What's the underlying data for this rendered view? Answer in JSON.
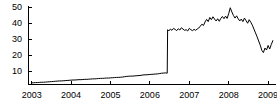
{
  "chart_data": {
    "type": "line",
    "title": "",
    "xlabel": "",
    "ylabel": "",
    "xlim": [
      2002.92,
      2009.2
    ],
    "ylim": [
      2.0,
      51.0
    ],
    "grid": false,
    "legend": null,
    "yticks": [
      10,
      20,
      30,
      40,
      50
    ],
    "ytick_labels": [
      "10",
      "20",
      "30",
      "40",
      "50"
    ],
    "xticks": [
      2003,
      2004,
      2005,
      2006,
      2007,
      2008,
      2009
    ],
    "xtick_labels": [
      "2003",
      "2004",
      "2005",
      "2006",
      "2007",
      "2008",
      "2009"
    ],
    "line_color": "#000000",
    "line_width": 1.0,
    "axis_color": "#000000",
    "background": "#ffffff",
    "annotations": [
      {
        "text": "level jump at mid-2006 from about 9 to about 36",
        "x": 2006.45,
        "y": 36
      }
    ],
    "series": [
      {
        "name": "series-1",
        "x": [
          2003.0,
          2003.05,
          2003.1,
          2003.15,
          2003.2,
          2003.25,
          2003.3,
          2003.35,
          2003.4,
          2003.45,
          2003.5,
          2003.55,
          2003.6,
          2003.65,
          2003.7,
          2003.75,
          2003.8,
          2003.85,
          2003.9,
          2003.95,
          2004.0,
          2004.05,
          2004.1,
          2004.15,
          2004.2,
          2004.25,
          2004.3,
          2004.35,
          2004.4,
          2004.45,
          2004.5,
          2004.55,
          2004.6,
          2004.65,
          2004.7,
          2004.75,
          2004.8,
          2004.85,
          2004.9,
          2004.95,
          2005.0,
          2005.05,
          2005.1,
          2005.15,
          2005.2,
          2005.25,
          2005.3,
          2005.35,
          2005.4,
          2005.45,
          2005.5,
          2005.55,
          2005.6,
          2005.65,
          2005.7,
          2005.75,
          2005.8,
          2005.85,
          2005.9,
          2005.95,
          2006.0,
          2006.05,
          2006.1,
          2006.15,
          2006.2,
          2006.25,
          2006.3,
          2006.35,
          2006.4,
          2006.44,
          2006.45,
          2006.48,
          2006.52,
          2006.56,
          2006.6,
          2006.64,
          2006.68,
          2006.72,
          2006.76,
          2006.8,
          2006.84,
          2006.88,
          2006.92,
          2006.96,
          2007.0,
          2007.04,
          2007.08,
          2007.12,
          2007.16,
          2007.2,
          2007.24,
          2007.28,
          2007.32,
          2007.36,
          2007.4,
          2007.44,
          2007.48,
          2007.52,
          2007.56,
          2007.6,
          2007.64,
          2007.68,
          2007.72,
          2007.76,
          2007.8,
          2007.84,
          2007.88,
          2007.92,
          2007.96,
          2008.0,
          2008.04,
          2008.08,
          2008.12,
          2008.16,
          2008.2,
          2008.24,
          2008.28,
          2008.32,
          2008.36,
          2008.4,
          2008.44,
          2008.48,
          2008.52,
          2008.56,
          2008.6,
          2008.64,
          2008.68,
          2008.72,
          2008.76,
          2008.8,
          2008.84,
          2008.88,
          2008.92,
          2008.96,
          2009.0,
          2009.04,
          2009.08,
          2009.12
        ],
        "y": [
          3.0,
          3.1,
          3.2,
          3.2,
          3.3,
          3.4,
          3.4,
          3.5,
          3.6,
          3.7,
          3.8,
          3.9,
          4.0,
          4.1,
          4.2,
          4.2,
          4.3,
          4.4,
          4.5,
          4.6,
          4.7,
          4.8,
          4.8,
          4.9,
          5.0,
          5.0,
          5.1,
          5.2,
          5.2,
          5.3,
          5.4,
          5.5,
          5.5,
          5.6,
          5.7,
          5.8,
          5.8,
          5.9,
          6.0,
          6.0,
          6.1,
          6.2,
          6.3,
          6.4,
          6.4,
          6.5,
          6.6,
          6.8,
          7.0,
          7.1,
          7.2,
          7.2,
          7.3,
          7.4,
          7.5,
          7.6,
          7.8,
          8.0,
          8.0,
          8.1,
          8.2,
          8.3,
          8.4,
          8.5,
          8.6,
          8.8,
          9.0,
          9.1,
          9.2,
          9.0,
          36.0,
          35.2,
          36.4,
          35.6,
          36.8,
          36.2,
          35.4,
          36.6,
          35.8,
          37.2,
          36.4,
          35.6,
          36.0,
          35.2,
          36.8,
          36.0,
          35.4,
          36.2,
          35.6,
          36.4,
          37.0,
          38.2,
          39.4,
          38.6,
          40.8,
          42.4,
          41.0,
          43.6,
          42.2,
          44.0,
          42.6,
          41.4,
          42.8,
          41.2,
          43.0,
          44.2,
          42.8,
          44.4,
          43.0,
          46.0,
          49.6,
          47.0,
          44.8,
          43.2,
          44.6,
          42.8,
          41.4,
          42.6,
          41.0,
          43.2,
          41.6,
          40.0,
          42.2,
          40.6,
          38.8,
          36.4,
          34.0,
          31.6,
          29.0,
          26.4,
          23.2,
          21.8,
          24.6,
          23.4,
          26.2,
          24.0,
          26.8,
          29.2
        ]
      }
    ]
  },
  "axis": {
    "y_axis_name": "y-axis",
    "x_axis_name": "x-axis"
  }
}
